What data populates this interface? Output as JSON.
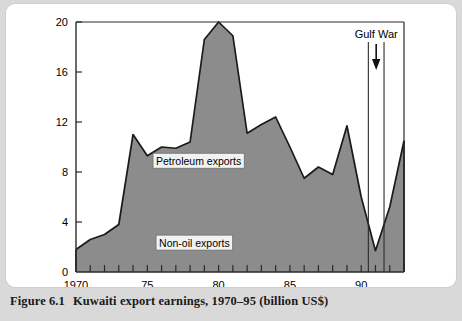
{
  "figure": {
    "number": "Figure 6.1",
    "caption": "Kuwaiti export earnings, 1970–95 (billion US$)"
  },
  "colors": {
    "page_background": "#d9d9d9",
    "card_background": "#ffffff",
    "area_fill": "#8c8c8c",
    "area_stroke": "#1a1a1a",
    "axis": "#2b2b2b",
    "label_box_fill": "#f2f2f2"
  },
  "annotations": {
    "gulf_war": {
      "label": "Gulf War",
      "arrow": "down-arrow",
      "line_years": [
        1990.5,
        1991.6
      ]
    },
    "series_labels": [
      {
        "text": "Petroleum exports",
        "x_year": 1978.6,
        "y_value": 8.9
      },
      {
        "text": "Non-oil exports",
        "x_year": 1978.3,
        "y_value": 2.35
      }
    ]
  },
  "chart_data": {
    "type": "area",
    "title": "Kuwaiti export earnings, 1970–95 (billion US$)",
    "xlabel": "",
    "ylabel": "",
    "xlim": [
      1970,
      1993
    ],
    "ylim": [
      0,
      20
    ],
    "ytick_values": [
      0,
      4,
      8,
      12,
      16,
      20
    ],
    "ytick_labels": [
      "0",
      "4",
      "8",
      "12",
      "16",
      "20"
    ],
    "xtick_major_values": [
      1970,
      1975,
      1980,
      1985,
      1990
    ],
    "xtick_major_labels": [
      "1970",
      "75",
      "80",
      "85",
      "90"
    ],
    "xtick_minor_step": 1,
    "grid": false,
    "legend_position": "inline-annotations",
    "series": [
      {
        "name": "Kuwaiti export earnings",
        "units": "billion US$",
        "x": [
          1970,
          1971,
          1972,
          1973,
          1974,
          1975,
          1976,
          1977,
          1978,
          1979,
          1980,
          1981,
          1982,
          1983,
          1984,
          1985,
          1986,
          1987,
          1988,
          1989,
          1990,
          1991,
          1992,
          1993
        ],
        "values": [
          1.8,
          2.6,
          3.0,
          3.8,
          11.0,
          9.3,
          10.0,
          9.9,
          10.4,
          18.6,
          20.0,
          18.9,
          11.1,
          11.8,
          12.4,
          10.0,
          7.5,
          8.4,
          7.8,
          11.7,
          6.0,
          1.7,
          5.2,
          10.5
        ]
      }
    ]
  }
}
